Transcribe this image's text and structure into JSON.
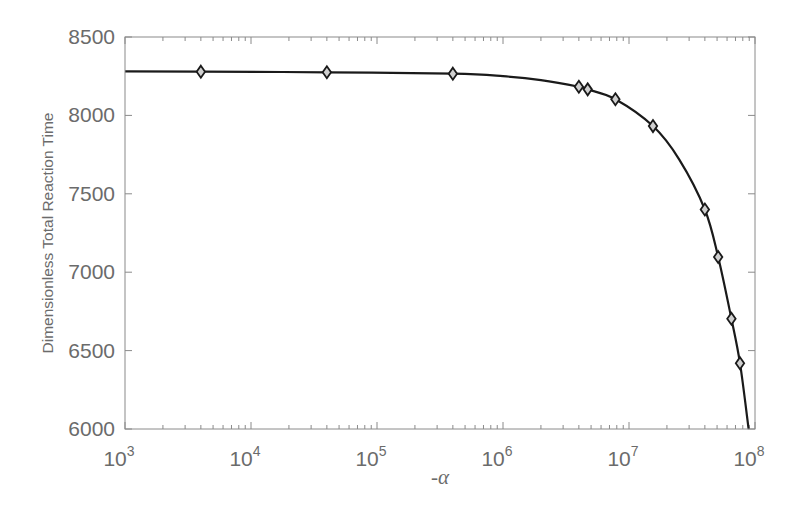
{
  "chart_data": {
    "type": "line",
    "title": "",
    "xlabel": "-α",
    "ylabel": "Dimensionless Total Reaction Time",
    "xscale": "log",
    "xlim": [
      1000,
      100000000
    ],
    "ylim": [
      6000,
      8500
    ],
    "grid": false,
    "legend": null,
    "xticks": [
      1000,
      10000,
      100000,
      1000000,
      10000000,
      100000000
    ],
    "xtick_labels": [
      {
        "base": "10",
        "exp": "3"
      },
      {
        "base": "10",
        "exp": "4"
      },
      {
        "base": "10",
        "exp": "5"
      },
      {
        "base": "10",
        "exp": "6"
      },
      {
        "base": "10",
        "exp": "7"
      },
      {
        "base": "10",
        "exp": "8"
      }
    ],
    "yticks": [
      6000,
      6500,
      7000,
      7500,
      8000,
      8500
    ],
    "ytick_labels": [
      "6000",
      "6500",
      "7000",
      "7500",
      "8000",
      "8500"
    ],
    "series": [
      {
        "name": "markers",
        "style": "diamond",
        "x": [
          4000,
          40000,
          400000,
          4000000,
          4700000,
          7800000,
          15500000,
          40000000,
          51000000,
          65000000,
          76000000
        ],
        "y": [
          8279,
          8275,
          8266,
          8183,
          8166,
          8103,
          7932,
          7400,
          7097,
          6703,
          6420
        ]
      },
      {
        "name": "fitted curve",
        "style": "solid",
        "x": [
          1000,
          4000,
          40000,
          400000,
          1000000,
          2000000,
          4000000,
          4700000,
          7800000,
          15500000,
          25000000,
          40000000,
          51000000,
          65000000,
          76000000,
          89000000
        ],
        "y": [
          8281,
          8279,
          8275,
          8266,
          8250,
          8225,
          8183,
          8166,
          8103,
          7932,
          7720,
          7400,
          7097,
          6703,
          6420,
          6000
        ]
      }
    ],
    "colors": {
      "line": "#1a1a1a",
      "axis": "#8a8a8a",
      "text": "#6b6b6b"
    }
  }
}
